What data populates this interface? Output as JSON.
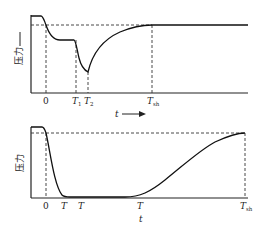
{
  "top_chart": {
    "y_label": "压力",
    "x_label": "t",
    "x_ticks": [
      {
        "main": "0",
        "sub": ""
      },
      {
        "main": "T",
        "sub": "1"
      },
      {
        "main": "T",
        "sub": "2"
      },
      {
        "main": "T",
        "sub": "sh"
      }
    ],
    "has_arrow": true
  },
  "bottom_chart": {
    "y_label": "压力",
    "x_label": "t",
    "x_ticks": [
      {
        "main": "0",
        "sub": ""
      },
      {
        "main": "T",
        "sub": ""
      },
      {
        "main": "T",
        "sub": ""
      },
      {
        "main": "T",
        "sub": ""
      },
      {
        "main": "T",
        "sub": "sh"
      }
    ]
  },
  "colors": {
    "line": "#111111",
    "background": "#ffffff"
  }
}
